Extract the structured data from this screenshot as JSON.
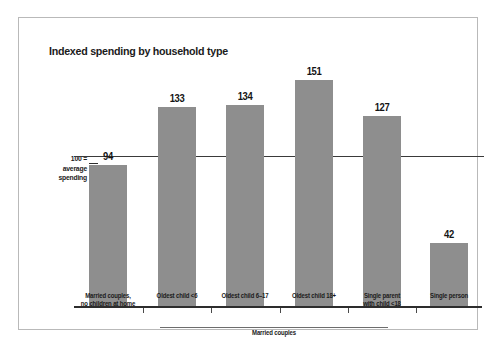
{
  "chart_data": {
    "type": "bar",
    "title": "Indexed spending by household type",
    "xlabel": "",
    "ylabel": "",
    "categories": [
      "Married couples,\nno children at home",
      "Oldest child <6",
      "Oldest child 6–17",
      "Oldest child 18+",
      "Single parent\nwith child <18",
      "Single person"
    ],
    "category_lines": [
      [
        "Married couples,",
        "no children at home"
      ],
      [
        "Oldest child <6",
        ""
      ],
      [
        "Oldest child 6–17",
        ""
      ],
      [
        "Oldest child 18+",
        ""
      ],
      [
        "Single parent",
        "with child <18"
      ],
      [
        "Single person",
        ""
      ]
    ],
    "values": [
      94,
      133,
      134,
      151,
      127,
      42
    ],
    "value_labels": [
      "94",
      "133",
      "134",
      "151",
      "127",
      "42"
    ],
    "ylim": [
      0,
      160
    ],
    "grid": false,
    "legend": null,
    "reference_line": {
      "value": 100,
      "label_lines": [
        "100 =",
        "average",
        "spending"
      ]
    },
    "group_bracket": {
      "label": "Married couples",
      "covers": [
        1,
        2,
        3
      ]
    },
    "colors": {
      "bar_fill": "#8e8e8e",
      "axis": "#2d2d2d",
      "reference_line": "#3a3a3a",
      "text": "#1b1b1b",
      "frame": "#b9b9b9",
      "background": "#ffffff"
    }
  }
}
